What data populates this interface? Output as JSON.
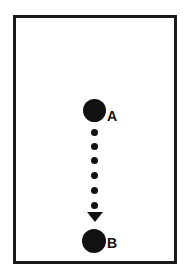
{
  "diagram": {
    "point_a": {
      "label": "A"
    },
    "point_b": {
      "label": "B"
    },
    "path": {
      "style": "dotted",
      "direction": "A to B",
      "dot_count": 6,
      "color": "#111111"
    }
  }
}
